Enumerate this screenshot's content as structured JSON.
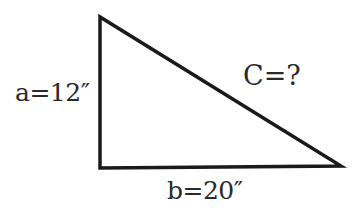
{
  "diagram": {
    "type": "right-triangle",
    "vertices": {
      "top": [
        100,
        17
      ],
      "right_angle": [
        100,
        168
      ],
      "far": [
        341,
        166
      ]
    },
    "stroke_color": "#1a1a1a",
    "labels": {
      "side_a": "a=12″",
      "side_b": "b=20″",
      "hypotenuse": "C=?"
    }
  }
}
